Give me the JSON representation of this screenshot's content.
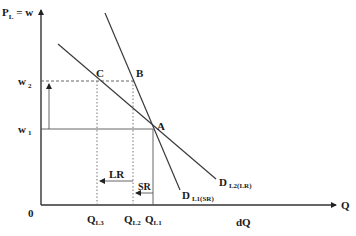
{
  "diagram": {
    "y_axis_label": "P",
    "y_axis_sub": "L",
    "y_axis_suffix": " = w",
    "x_axis_label": "Q",
    "origin_label": "0",
    "x_extra_label": "dQ",
    "wage_levels": [
      {
        "label": "w",
        "sub": "2"
      },
      {
        "label": "w",
        "sub": "1"
      }
    ],
    "quantities": [
      {
        "label": "Q",
        "sub": "L3"
      },
      {
        "label": "Q",
        "sub": "L2"
      },
      {
        "label": "Q",
        "sub": "L1"
      }
    ],
    "points": [
      {
        "label": "A"
      },
      {
        "label": "B"
      },
      {
        "label": "C"
      }
    ],
    "curves": [
      {
        "label": "D",
        "sub": "L1(SR)",
        "description": "short-run labour demand (steep)"
      },
      {
        "label": "D",
        "sub": "L2(LR)",
        "description": "long-run labour demand (flat)"
      }
    ],
    "arrows": [
      {
        "label": "LR"
      },
      {
        "label": "SR"
      }
    ],
    "colors": {
      "line": "#3a3a3a",
      "text": "#1a1a1a",
      "background": "#ffffff"
    }
  }
}
